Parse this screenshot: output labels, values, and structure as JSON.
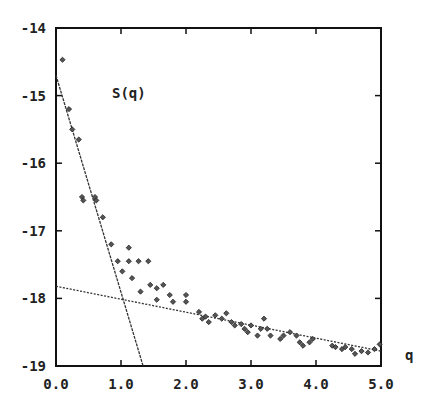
{
  "chart_data": {
    "type": "scatter",
    "title": "",
    "annotation": "S(q)",
    "xlabel": "q",
    "ylabel": "",
    "xlim": [
      0.0,
      5.0
    ],
    "ylim": [
      -19,
      -14
    ],
    "xticks": [
      0.0,
      1.0,
      2.0,
      3.0,
      4.0,
      5.0
    ],
    "xtick_labels": [
      "0.0",
      "1.0",
      "2.0",
      "3.0",
      "4.0",
      "5.0"
    ],
    "yticks": [
      -14,
      -15,
      -16,
      -17,
      -18,
      -19
    ],
    "ytick_labels": [
      "-14",
      "-15",
      "-16",
      "-17",
      "-18",
      "-19"
    ],
    "grid": false,
    "legend": null,
    "series": [
      {
        "name": "data",
        "marker": "diamond",
        "points": [
          [
            0.1,
            -14.47
          ],
          [
            0.2,
            -15.2
          ],
          [
            0.25,
            -15.5
          ],
          [
            0.35,
            -15.65
          ],
          [
            0.4,
            -16.5
          ],
          [
            0.42,
            -16.55
          ],
          [
            0.6,
            -16.5
          ],
          [
            0.62,
            -16.55
          ],
          [
            0.72,
            -16.8
          ],
          [
            0.85,
            -17.2
          ],
          [
            0.95,
            -17.45
          ],
          [
            1.02,
            -17.6
          ],
          [
            1.12,
            -17.25
          ],
          [
            1.12,
            -17.45
          ],
          [
            1.17,
            -17.7
          ],
          [
            1.27,
            -17.45
          ],
          [
            1.42,
            -17.45
          ],
          [
            1.3,
            -17.9
          ],
          [
            1.45,
            -17.8
          ],
          [
            1.55,
            -17.85
          ],
          [
            1.55,
            -18.02
          ],
          [
            1.65,
            -17.8
          ],
          [
            1.75,
            -17.95
          ],
          [
            1.8,
            -18.05
          ],
          [
            2.0,
            -17.95
          ],
          [
            2.0,
            -18.05
          ],
          [
            2.2,
            -18.2
          ],
          [
            2.25,
            -18.3
          ],
          [
            2.3,
            -18.27
          ],
          [
            2.35,
            -18.35
          ],
          [
            2.45,
            -18.25
          ],
          [
            2.55,
            -18.3
          ],
          [
            2.62,
            -18.22
          ],
          [
            2.7,
            -18.35
          ],
          [
            2.75,
            -18.4
          ],
          [
            2.85,
            -18.38
          ],
          [
            2.9,
            -18.45
          ],
          [
            2.95,
            -18.5
          ],
          [
            3.0,
            -18.4
          ],
          [
            3.1,
            -18.55
          ],
          [
            3.15,
            -18.45
          ],
          [
            3.2,
            -18.3
          ],
          [
            3.25,
            -18.45
          ],
          [
            3.3,
            -18.55
          ],
          [
            3.45,
            -18.6
          ],
          [
            3.5,
            -18.55
          ],
          [
            3.6,
            -18.5
          ],
          [
            3.7,
            -18.55
          ],
          [
            3.75,
            -18.65
          ],
          [
            3.8,
            -18.7
          ],
          [
            3.9,
            -18.65
          ],
          [
            3.95,
            -18.6
          ],
          [
            4.25,
            -18.7
          ],
          [
            4.3,
            -18.72
          ],
          [
            4.4,
            -18.75
          ],
          [
            4.45,
            -18.72
          ],
          [
            4.55,
            -18.75
          ],
          [
            4.6,
            -18.82
          ],
          [
            4.7,
            -18.78
          ],
          [
            4.8,
            -18.8
          ],
          [
            4.9,
            -18.75
          ],
          [
            4.98,
            -18.68
          ]
        ]
      }
    ],
    "fit_lines": [
      {
        "name": "steep-fit",
        "style": "dashed",
        "from": [
          0.0,
          -14.7
        ],
        "to": [
          1.34,
          -19.0
        ]
      },
      {
        "name": "shallow-fit",
        "style": "dotted",
        "from": [
          0.0,
          -17.82
        ],
        "to": [
          5.0,
          -18.78
        ]
      }
    ]
  }
}
